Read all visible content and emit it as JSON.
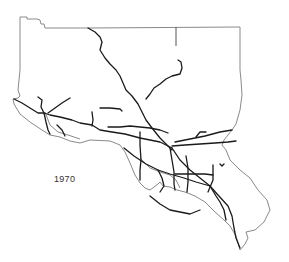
{
  "map": {
    "title": "Freeway network",
    "year_label": "1970",
    "colors": {
      "background": "#ffffff",
      "coastline_boundary": "#8a8a8a",
      "freeway": "#1a1a1a",
      "label": "#333333"
    },
    "layers": [
      "region-boundary",
      "interior-county-line",
      "freeways"
    ]
  }
}
